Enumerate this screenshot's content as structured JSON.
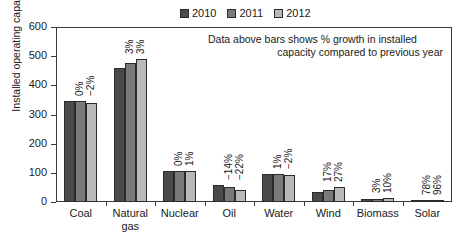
{
  "legend": {
    "entries": [
      {
        "label": "2010",
        "color": "#4a4a4a"
      },
      {
        "label": "2011",
        "color": "#7a7a7a"
      },
      {
        "label": "2012",
        "color": "#b9b9b9"
      }
    ]
  },
  "annotation": {
    "line1": "Data above bars shows % growth in installed",
    "line2": "capacity compared to previous year"
  },
  "axes": {
    "y_title": "Installed operating capacity (GW)",
    "y_ticks": [
      "0",
      "100",
      "200",
      "300",
      "400",
      "500",
      "600"
    ]
  },
  "chart_data": {
    "type": "bar",
    "title": "",
    "xlabel": "",
    "ylabel": "Installed operating capacity (GW)",
    "ylim": [
      0,
      600
    ],
    "ytick_values": [
      0,
      100,
      200,
      300,
      400,
      500,
      600
    ],
    "grid": false,
    "legend_position": "top-center",
    "categories": [
      "Coal",
      "Natural gas",
      "Nuclear",
      "Oil",
      "Water",
      "Wind",
      "Biomass",
      "Solar"
    ],
    "category_lines": [
      [
        "Coal"
      ],
      [
        "Natural",
        "gas"
      ],
      [
        "Nuclear"
      ],
      [
        "Oil"
      ],
      [
        "Water"
      ],
      [
        "Wind"
      ],
      [
        "Biomass"
      ],
      [
        "Solar"
      ]
    ],
    "series": [
      {
        "name": "2010",
        "color": "#4a4a4a",
        "values": [
          345,
          460,
          107,
          60,
          95,
          35,
          12,
          2
        ]
      },
      {
        "name": "2011",
        "color": "#7a7a7a",
        "values": [
          345,
          475,
          107,
          52,
          96,
          41,
          12,
          4
        ]
      },
      {
        "name": "2012",
        "color": "#b9b9b9",
        "values": [
          338,
          490,
          108,
          40,
          94,
          52,
          13,
          8
        ]
      }
    ],
    "bar_labels": [
      {
        "category": "Coal",
        "labels": [
          "",
          "0%",
          "-2%"
        ]
      },
      {
        "category": "Natural gas",
        "labels": [
          "",
          "3%",
          "3%"
        ]
      },
      {
        "category": "Nuclear",
        "labels": [
          "",
          "0%",
          "1%"
        ]
      },
      {
        "category": "Oil",
        "labels": [
          "",
          "-14%",
          "-22%"
        ]
      },
      {
        "category": "Water",
        "labels": [
          "",
          "1%",
          "-2%"
        ]
      },
      {
        "category": "Wind",
        "labels": [
          "",
          "17%",
          "27%"
        ]
      },
      {
        "category": "Biomass",
        "labels": [
          "",
          "3%",
          "10%"
        ]
      },
      {
        "category": "Solar",
        "labels": [
          "",
          "78%",
          "96%"
        ]
      }
    ],
    "annotation": "Data above bars shows % growth in installed capacity compared to previous year"
  }
}
